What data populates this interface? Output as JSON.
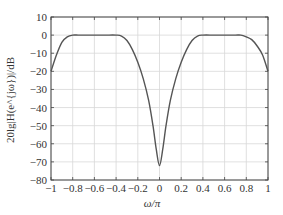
{
  "chart_data": {
    "type": "line",
    "title": "",
    "xlabel": "ω/π",
    "ylabel": "20lg|H(e^{jω})|/dB",
    "xlim": [
      -1,
      1
    ],
    "ylim": [
      -80,
      10
    ],
    "grid": true,
    "legend": null,
    "xticks": [
      -1,
      -0.8,
      -0.6,
      -0.4,
      -0.2,
      0,
      0.2,
      0.4,
      0.6,
      0.8,
      1
    ],
    "xtick_labels": [
      "−1",
      "−0.8",
      "−0.6",
      "−0.4",
      "−0.2",
      "0",
      "0.2",
      "0.4",
      "0.6",
      "0.8",
      "1"
    ],
    "yticks": [
      10,
      0,
      -10,
      -20,
      -30,
      -40,
      -50,
      -60,
      -70,
      -80
    ],
    "ytick_labels": [
      "10",
      "0",
      "−10",
      "−20",
      "−30",
      "−40",
      "−50",
      "−60",
      "−70",
      "−80"
    ],
    "series": [
      {
        "name": "magnitude response",
        "color": "#555555",
        "x": [
          -1,
          -0.95,
          -0.9,
          -0.85,
          -0.8,
          -0.75,
          -0.7,
          -0.6,
          -0.5,
          -0.4,
          -0.35,
          -0.3,
          -0.25,
          -0.2,
          -0.15,
          -0.1,
          -0.06,
          -0.03,
          0,
          0.03,
          0.06,
          0.1,
          0.15,
          0.2,
          0.25,
          0.3,
          0.35,
          0.4,
          0.5,
          0.6,
          0.7,
          0.75,
          0.8,
          0.85,
          0.9,
          0.95,
          1
        ],
        "y": [
          -20,
          -11,
          -4,
          -1,
          0,
          0,
          0,
          0,
          0,
          0,
          -0.5,
          -3,
          -8,
          -15,
          -24,
          -36,
          -50,
          -63,
          -72,
          -63,
          -50,
          -36,
          -24,
          -15,
          -8,
          -3,
          -0.5,
          0,
          0,
          0,
          0,
          0,
          -1,
          -2.5,
          -6,
          -11,
          -20
        ]
      }
    ]
  }
}
